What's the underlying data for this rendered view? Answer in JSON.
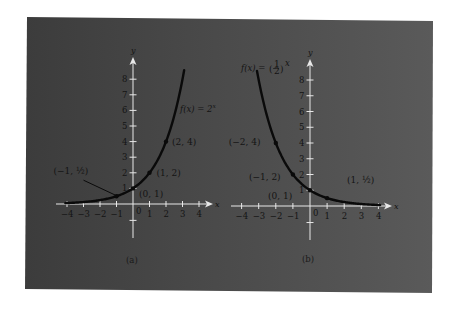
{
  "figure": {
    "panel_color_left": "#3c3c3c",
    "panel_color_right": "#5a5a5a",
    "axis_color": "#e8e8e8",
    "curve_color": "#0a0a0a"
  },
  "chart_data": [
    {
      "type": "line",
      "caption": "(a)",
      "function_label": "f(x) = 2^x",
      "function": "2^x",
      "xlabel": "x",
      "ylabel": "y",
      "xlim": [
        -4,
        4
      ],
      "ylim": [
        -1,
        8
      ],
      "x_ticks": [
        -4,
        -3,
        -2,
        -1,
        1,
        2,
        3,
        4
      ],
      "x_tick_labels": [
        "−4",
        "−3",
        "−2",
        "−1",
        "1",
        "2",
        "3",
        "4"
      ],
      "y_ticks": [
        1,
        2,
        3,
        4,
        5,
        6,
        7,
        8
      ],
      "y_tick_labels": [
        "1",
        "2",
        "3",
        "4",
        "5",
        "6",
        "7",
        "8"
      ],
      "origin_label": "0",
      "grid": false,
      "points": [
        {
          "x": -1,
          "y": 0.5,
          "label": "(−1, ½)"
        },
        {
          "x": 0,
          "y": 1,
          "label": "(0, 1)"
        },
        {
          "x": 1,
          "y": 2,
          "label": "(1, 2)"
        },
        {
          "x": 2,
          "y": 4,
          "label": "(2, 4)"
        }
      ],
      "curve_x_range": [
        -4.1,
        3.1
      ]
    },
    {
      "type": "line",
      "caption": "(b)",
      "function_label": "f(x) = (½)^x",
      "function": "(1/2)^x",
      "xlabel": "x",
      "ylabel": "y",
      "xlim": [
        -4,
        4
      ],
      "ylim": [
        -1,
        8
      ],
      "x_ticks": [
        -4,
        -3,
        -2,
        -1,
        1,
        2,
        3,
        4
      ],
      "x_tick_labels": [
        "−4",
        "−3",
        "−2",
        "−1",
        "1",
        "2",
        "3",
        "4"
      ],
      "y_ticks": [
        1,
        2,
        3,
        4,
        5,
        6,
        7,
        8
      ],
      "y_tick_labels": [
        "1",
        "2",
        "3",
        "4",
        "5",
        "6",
        "7",
        "8"
      ],
      "origin_label": "0",
      "grid": false,
      "points": [
        {
          "x": -2,
          "y": 4,
          "label": "(−2, 4)"
        },
        {
          "x": -1,
          "y": 2,
          "label": "(−1, 2)"
        },
        {
          "x": 0,
          "y": 1,
          "label": "(0, 1)"
        },
        {
          "x": 1,
          "y": 0.5,
          "label": "(1, ½)"
        }
      ],
      "curve_x_range": [
        -3.1,
        4.1
      ]
    }
  ]
}
